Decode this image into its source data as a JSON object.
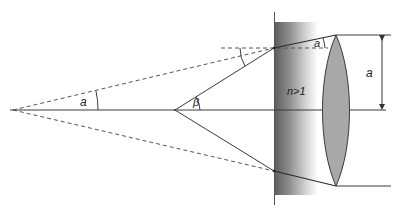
{
  "diagram": {
    "type": "optics-ray-diagram",
    "labels": {
      "alpha_left": "a",
      "beta": "β",
      "alpha_refracted": "a",
      "refractive_index": "n>1",
      "height_dimension": "a"
    },
    "colors": {
      "line": "#3a3a3a",
      "dashed": "#555555",
      "slab_dark": "#5a5a5a",
      "slab_light": "#ffffff",
      "lens_fill": "#a8a8a8",
      "lens_stroke": "#3a3a3a"
    }
  }
}
